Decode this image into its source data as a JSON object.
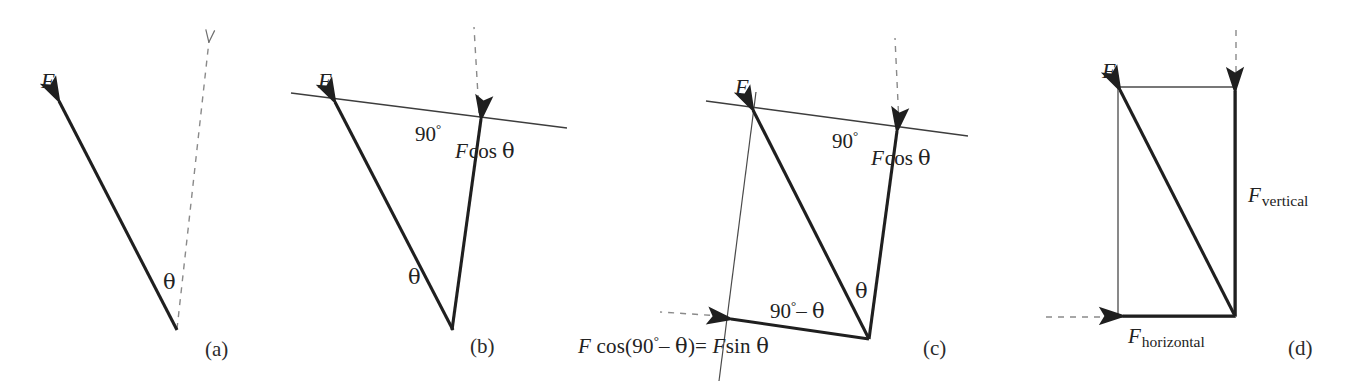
{
  "figure": {
    "background_color": "#ffffff",
    "ink_color": "#1f1f1f",
    "thin_line_color": "#4a4a4a",
    "dashed_color": "#7d7d7d"
  },
  "panels": [
    {
      "id": "a",
      "caption": "(a)",
      "labels": {
        "force": "F",
        "theta": "θ"
      },
      "elements": [
        "force-vector-F",
        "dashed-vertical-reference-arrow",
        "angle-theta-label"
      ]
    },
    {
      "id": "b",
      "caption": "(b)",
      "labels": {
        "force": "F",
        "right_angle": "90",
        "right_angle_degree_symbol": "°",
        "component": "F cos θ",
        "component_var": "F",
        "component_func": "cos",
        "component_angle": "θ",
        "theta": "θ"
      },
      "elements": [
        "force-vector-F",
        "component-vector-fcos-theta",
        "surface-line",
        "dashed-vertical-reference",
        "angle-theta-label",
        "right-angle-label"
      ]
    },
    {
      "id": "c",
      "caption": "(c)",
      "labels": {
        "force": "F",
        "right_angle": "90",
        "right_angle_degree_symbol": "°",
        "component_perp": "F cos θ",
        "component_perp_var": "F",
        "component_perp_func": "cos",
        "component_perp_angle": "θ",
        "angle_complement": "90°– θ",
        "angle_complement_number": "90",
        "angle_complement_degree_symbol": "°",
        "angle_complement_minus": "–",
        "angle_complement_theta": "θ",
        "theta": "θ",
        "equation": "F cos(90°– θ) = F sin θ",
        "equation_lhs_var": "F",
        "equation_lhs_func": "cos(",
        "equation_lhs_number": "90",
        "equation_lhs_degree": "°",
        "equation_lhs_minus": "– ",
        "equation_lhs_theta": "θ",
        "equation_lhs_close": ")",
        "equation_equals": "=",
        "equation_rhs_var": "F",
        "equation_rhs_func": "sin",
        "equation_rhs_theta": "θ"
      },
      "elements": [
        "force-vector-F",
        "component-vector-fcos-theta",
        "component-vector-fsin-theta",
        "surface-line",
        "construction-line",
        "dashed-vertical-reference",
        "dashed-horizontal-reference",
        "angle-theta-label",
        "angle-complement-label",
        "right-angle-label",
        "equation-label"
      ]
    },
    {
      "id": "d",
      "caption": "(d)",
      "labels": {
        "force": "F",
        "vertical_component_var": "F",
        "vertical_component_sub": "vertical",
        "horizontal_component_var": "F",
        "horizontal_component_sub": "horizontal"
      },
      "elements": [
        "force-vector-F",
        "vertical-component-vector",
        "horizontal-component-vector",
        "rectangle-construction-lines",
        "dashed-vertical-reference",
        "dashed-horizontal-reference"
      ]
    }
  ]
}
